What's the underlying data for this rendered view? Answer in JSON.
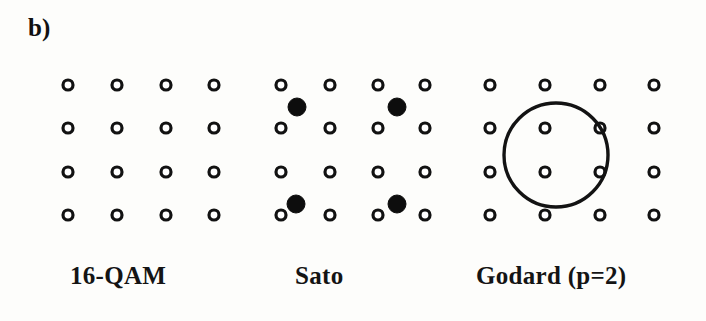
{
  "figure": {
    "part_label": "b)",
    "background_color": "#fdfdfb",
    "ink_color": "#121212",
    "width": 706,
    "height": 321
  },
  "chart_data": {
    "type": "scatter",
    "title": "b)",
    "xlabel": "",
    "ylabel": "",
    "grid": false,
    "legend_position": "none",
    "subplots": [
      {
        "id": "16-qam",
        "label": "16-QAM",
        "label_x": 70,
        "label_y": 262,
        "description": "Ideal 16-QAM signal constellation: 4 by 4 square lattice of open circles",
        "point_radius": 5,
        "columns_x": [
          68,
          117,
          166,
          214
        ],
        "rows_y": [
          85,
          128,
          172,
          215
        ],
        "series": [
          {
            "name": "constellation-points",
            "marker": "open-circle",
            "count": 16,
            "points": [
              {
                "x": 68,
                "y": 85
              },
              {
                "x": 117,
                "y": 85
              },
              {
                "x": 166,
                "y": 85
              },
              {
                "x": 214,
                "y": 85
              },
              {
                "x": 68,
                "y": 128
              },
              {
                "x": 117,
                "y": 128
              },
              {
                "x": 166,
                "y": 128
              },
              {
                "x": 214,
                "y": 128
              },
              {
                "x": 68,
                "y": 172
              },
              {
                "x": 117,
                "y": 172
              },
              {
                "x": 166,
                "y": 172
              },
              {
                "x": 214,
                "y": 172
              },
              {
                "x": 68,
                "y": 215
              },
              {
                "x": 117,
                "y": 215
              },
              {
                "x": 166,
                "y": 215
              },
              {
                "x": 214,
                "y": 215
              }
            ]
          }
        ],
        "overlays": []
      },
      {
        "id": "sato",
        "label": "Sato",
        "label_x": 295,
        "label_y": 262,
        "description": "Sato algorithm constellation: 4 by 4 open-circle lattice plus four filled convergence points offset between rows",
        "point_radius": 5,
        "filled_radius": 9,
        "columns_x": [
          281,
          330,
          378,
          425
        ],
        "rows_y": [
          85,
          128,
          172,
          215
        ],
        "series": [
          {
            "name": "constellation-points",
            "marker": "open-circle",
            "count": 16,
            "points": [
              {
                "x": 281,
                "y": 85
              },
              {
                "x": 330,
                "y": 85
              },
              {
                "x": 378,
                "y": 85
              },
              {
                "x": 425,
                "y": 85
              },
              {
                "x": 281,
                "y": 128
              },
              {
                "x": 330,
                "y": 128
              },
              {
                "x": 378,
                "y": 128
              },
              {
                "x": 425,
                "y": 128
              },
              {
                "x": 281,
                "y": 172
              },
              {
                "x": 330,
                "y": 172
              },
              {
                "x": 378,
                "y": 172
              },
              {
                "x": 425,
                "y": 172
              },
              {
                "x": 281,
                "y": 215
              },
              {
                "x": 330,
                "y": 215
              },
              {
                "x": 378,
                "y": 215
              },
              {
                "x": 425,
                "y": 215
              }
            ]
          },
          {
            "name": "filled-points",
            "marker": "filled-circle",
            "count": 4,
            "points": [
              {
                "x": 297,
                "y": 107
              },
              {
                "x": 397,
                "y": 107
              },
              {
                "x": 296,
                "y": 204
              },
              {
                "x": 397,
                "y": 204
              }
            ]
          }
        ],
        "overlays": []
      },
      {
        "id": "godard",
        "label": "Godard (p=2)",
        "label_x": 476,
        "label_y": 262,
        "description": "Godard p=2 constellation: 4 by 4 open-circle lattice with a large circle of constant modulus enclosing the four inner points",
        "point_radius": 5,
        "columns_x": [
          490,
          545,
          600,
          654
        ],
        "rows_y": [
          85,
          128,
          172,
          215
        ],
        "series": [
          {
            "name": "constellation-points",
            "marker": "open-circle",
            "count": 16,
            "points": [
              {
                "x": 490,
                "y": 85
              },
              {
                "x": 545,
                "y": 85
              },
              {
                "x": 600,
                "y": 85
              },
              {
                "x": 654,
                "y": 85
              },
              {
                "x": 490,
                "y": 128
              },
              {
                "x": 545,
                "y": 128
              },
              {
                "x": 600,
                "y": 128
              },
              {
                "x": 654,
                "y": 128
              },
              {
                "x": 490,
                "y": 172
              },
              {
                "x": 545,
                "y": 172
              },
              {
                "x": 600,
                "y": 172
              },
              {
                "x": 654,
                "y": 172
              },
              {
                "x": 490,
                "y": 215
              },
              {
                "x": 545,
                "y": 215
              },
              {
                "x": 600,
                "y": 215
              },
              {
                "x": 654,
                "y": 215
              }
            ]
          }
        ],
        "overlays": [
          {
            "name": "constant-modulus-ring",
            "shape": "circle",
            "cx": 556,
            "cy": 155,
            "r": 52
          }
        ]
      }
    ]
  }
}
